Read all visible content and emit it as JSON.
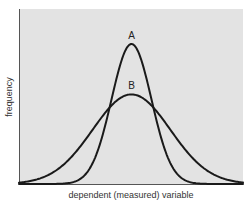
{
  "chart_data": {
    "type": "line",
    "title": "",
    "xlabel": "dependent (measured) variable",
    "ylabel": "frequency",
    "xlim": [
      -113,
      112
    ],
    "ylim": [
      0,
      1.25
    ],
    "grid": false,
    "legend": "none",
    "axis_ticks": false,
    "series": [
      {
        "name": "A",
        "kind": "normal",
        "mean": 0,
        "sd": 20,
        "peak": 1.0
      },
      {
        "name": "B",
        "kind": "normal",
        "mean": 0,
        "sd": 39,
        "peak": 0.64
      }
    ],
    "annotations": [
      {
        "text": "A",
        "series": "A",
        "position": "above-peak"
      },
      {
        "text": "B",
        "series": "B",
        "position": "above-peak"
      }
    ],
    "colors": {
      "plot_background": "#e3e3e3",
      "curve": "#1a1a1a",
      "axis": "#555555"
    }
  }
}
